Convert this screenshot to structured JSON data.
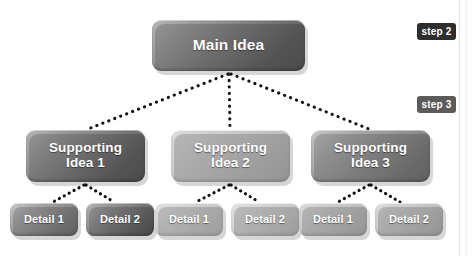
{
  "diagram": {
    "type": "tree",
    "root": {
      "id": "main",
      "label": "Main Idea",
      "tone": "dark"
    },
    "level2": [
      {
        "id": "support-1",
        "label": "Supporting\nIdea 1",
        "tone": "dark"
      },
      {
        "id": "support-2",
        "label": "Supporting\nIdea 2",
        "tone": "light"
      },
      {
        "id": "support-3",
        "label": "Supporting\nIdea 3",
        "tone": "mid"
      }
    ],
    "level3": [
      {
        "id": "detail-1-1",
        "label": "Detail 1",
        "parent": "support-1",
        "tone": "mid"
      },
      {
        "id": "detail-1-2",
        "label": "Detail 2",
        "parent": "support-1",
        "tone": "dark"
      },
      {
        "id": "detail-2-1",
        "label": "Detail 1",
        "parent": "support-2",
        "tone": "pale"
      },
      {
        "id": "detail-2-2",
        "label": "Detail 2",
        "parent": "support-2",
        "tone": "pale"
      },
      {
        "id": "detail-3-1",
        "label": "Detail 1",
        "parent": "support-3",
        "tone": "light"
      },
      {
        "id": "detail-3-2",
        "label": "Detail 2",
        "parent": "support-3",
        "tone": "light"
      }
    ],
    "connector_style": "dotted"
  },
  "annotations": {
    "badges": [
      {
        "id": "step-2",
        "label": "step 2",
        "color": "#2e2e2e"
      },
      {
        "id": "step-3",
        "label": "step 3",
        "color": "#5b5b5b"
      }
    ]
  },
  "colors": {
    "background": "#ffffff",
    "text": "#ffffff",
    "connector": "#141414",
    "badge_dark": "#2e2e2e",
    "badge_mid": "#5b5b5b"
  }
}
